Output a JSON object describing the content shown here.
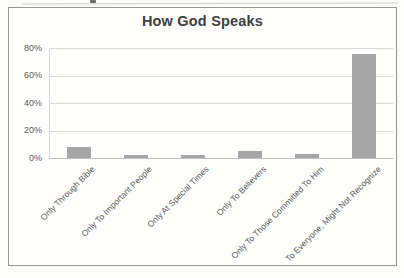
{
  "chart": {
    "title": "How God Speaks"
  },
  "chart_data": {
    "type": "bar",
    "title": "How God Speaks",
    "categories": [
      "Only Through Bible",
      "Only To Important People",
      "Only At Special Times",
      "Only To Believers",
      "Only To Those Committed To Him",
      "To Everyone, Might Not Recognize"
    ],
    "values": [
      8,
      2,
      2,
      5,
      3,
      76
    ],
    "unit": "%",
    "xlabel": "",
    "ylabel": "",
    "ylim": [
      0,
      80
    ],
    "ytick_values": [
      0,
      20,
      40,
      60,
      80
    ],
    "yticks": [
      "0%",
      "20%",
      "40%",
      "60%",
      "80%"
    ],
    "grid": true,
    "legend": false,
    "bar_color": "#a6a6a6",
    "gridline_color": "#d9d9d9",
    "axis_color": "#bfbfbf",
    "text_color": "#595959",
    "title_color": "#404040",
    "frame_border_color": "#969696"
  }
}
